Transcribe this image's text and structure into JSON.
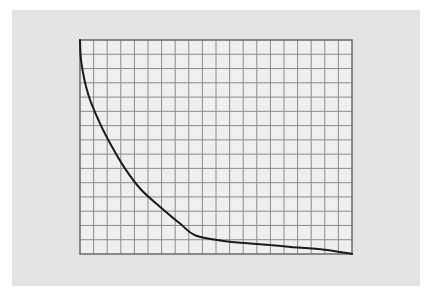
{
  "colors": {
    "page_background": "#ffffff",
    "panel_background": "#e4e4e4",
    "plot_background": "#efefef",
    "grid_line": "#8c8c8c",
    "frame": "#6a6a6a",
    "curve": "#1a1a1a"
  },
  "chart_data": {
    "type": "line",
    "title": "",
    "xlabel": "",
    "ylabel": "",
    "grid": true,
    "grid_columns": 20,
    "grid_rows": 15,
    "xlim": [
      0,
      20
    ],
    "ylim": [
      0,
      15
    ],
    "legend": null,
    "series": [
      {
        "name": "decay-curve",
        "x": [
          0,
          0.1,
          0.6,
          1.4,
          2.3,
          3.3,
          4.5,
          5.9,
          7.4,
          8.5,
          10.7,
          13.0,
          15.5,
          18.0,
          20.0
        ],
        "y": [
          15,
          13.4,
          11.2,
          9.3,
          7.6,
          6.0,
          4.5,
          3.3,
          2.1,
          1.3,
          0.9,
          0.7,
          0.5,
          0.3,
          0.0
        ]
      }
    ],
    "annotations": []
  }
}
